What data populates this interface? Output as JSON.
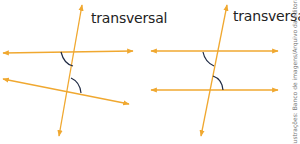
{
  "figures": [
    {
      "id": "non-parallel",
      "label": "transversal",
      "lines": [
        {
          "role": "line-a",
          "x1": 3,
          "y1": 53,
          "x2": 133,
          "y2": 51
        },
        {
          "role": "line-b",
          "x1": 3,
          "y1": 79,
          "x2": 129,
          "y2": 104
        },
        {
          "role": "transversal",
          "x1": 82,
          "y1": 5,
          "x2": 59,
          "y2": 136
        }
      ],
      "arcs": [
        {
          "path": "M61,52 Q64,64 73,66"
        },
        {
          "path": "M71,78 Q80,82 81,93"
        }
      ]
    },
    {
      "id": "parallel",
      "label": "transversal",
      "lines": [
        {
          "role": "line-a",
          "x1": 151,
          "y1": 51,
          "x2": 278,
          "y2": 51
        },
        {
          "role": "line-b",
          "x1": 151,
          "y1": 90,
          "x2": 278,
          "y2": 90
        },
        {
          "role": "transversal",
          "x1": 227,
          "y1": 5,
          "x2": 201,
          "y2": 136
        }
      ],
      "arcs": [
        {
          "path": "M203,52 Q205,62 214,66"
        },
        {
          "path": "M213,76 Q222,79 223,90"
        }
      ]
    }
  ],
  "credit": "Ilustrações: Banco de imagens/Arquivo da editora",
  "colors": {
    "line": "#f0a830",
    "arc": "#1f2a44",
    "text": "#222222"
  }
}
